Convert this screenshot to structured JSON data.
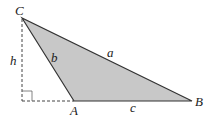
{
  "diagram": {
    "vertices": {
      "A": {
        "label": "A",
        "x": 74,
        "y": 101
      },
      "B": {
        "label": "B",
        "x": 192,
        "y": 101
      },
      "C": {
        "label": "C",
        "x": 22,
        "y": 18
      }
    },
    "sides": {
      "a": {
        "label": "a",
        "from": "C",
        "to": "B"
      },
      "b": {
        "label": "b",
        "from": "C",
        "to": "A"
      },
      "c": {
        "label": "c",
        "from": "A",
        "to": "B"
      }
    },
    "altitude": {
      "label": "h",
      "style": "dashed",
      "foot": {
        "x": 22,
        "y": 101
      }
    },
    "extension": {
      "style": "dashed",
      "from": "foot",
      "to": "A"
    },
    "right_angle_marker": true,
    "colors": {
      "fill": "#c8c8c8",
      "stroke": "#333333",
      "dashed": "#444444"
    }
  }
}
